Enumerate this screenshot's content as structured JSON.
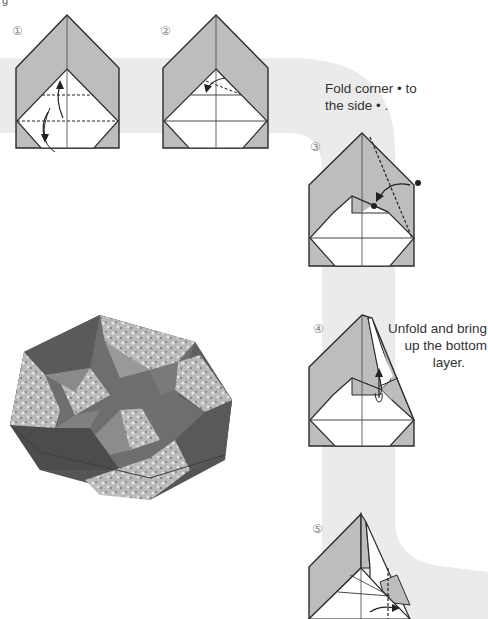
{
  "page": {
    "corner_label": "g",
    "background_color": "#ffffff",
    "path_band_color": "#ebebeb",
    "paper_color_colored": "#bdbdbd",
    "paper_color_white": "#ffffff",
    "line_color": "#2b2b2b"
  },
  "steps": [
    {
      "number": "①",
      "caption": ""
    },
    {
      "number": "②",
      "caption": ""
    },
    {
      "number": "③",
      "caption_line1": "Fold corner • to",
      "caption_line2": "the side • ."
    },
    {
      "number": "④",
      "caption_line1": "Unfold and bring",
      "caption_line2": "up the bottom",
      "caption_line3": "layer."
    },
    {
      "number": "⑤",
      "caption": ""
    }
  ],
  "photo": {
    "subject": "finished heptagonal origami box (floral patterned paper with solid dark panels)"
  }
}
